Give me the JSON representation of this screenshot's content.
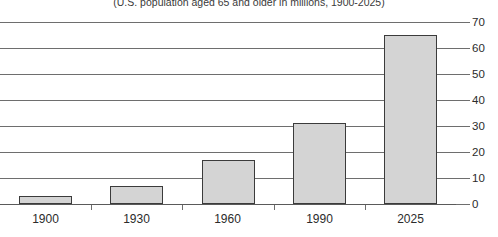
{
  "chart_data": {
    "type": "bar",
    "title": "(U.S. population aged 65 and older in millions, 1900-2025)",
    "xlabel": "",
    "ylabel": "",
    "categories": [
      "1900",
      "1930",
      "1960",
      "1990",
      "2025"
    ],
    "values": [
      3,
      7,
      17,
      31,
      65
    ],
    "series": [
      {
        "name": "U.S. population aged 65 and older",
        "values": [
          3,
          7,
          17,
          31,
          65
        ]
      }
    ],
    "ylim": [
      0,
      70
    ],
    "yticks": [
      0,
      10,
      20,
      30,
      40,
      50,
      60,
      70
    ],
    "ytick_labels": [
      "0",
      "10",
      "20",
      "30",
      "40",
      "50",
      "60",
      "70"
    ],
    "y_axis_position": "right",
    "grid": true,
    "grid_orientation": "horizontal",
    "legend": false,
    "legend_position": "none",
    "bar_fill_color": "#d4d4d4",
    "bar_border_color": "#3b3b3b",
    "gridline_color": "#6e6e6e",
    "background_color": "#ffffff"
  }
}
